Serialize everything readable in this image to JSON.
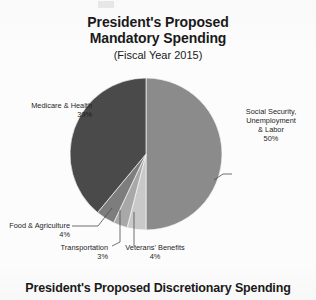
{
  "header": {
    "title_line1": "President's Proposed",
    "title_line2": "Mandatory Spending",
    "subtitle": "(Fiscal Year 2015)"
  },
  "footer": {
    "heading": "President's Proposed Discretionary Spending"
  },
  "labels": {
    "medicare_name": "Medicare & Health",
    "medicare_value": "39%",
    "social_line1": "Social Security,",
    "social_line2": "Unemployment",
    "social_line3": "& Labor",
    "social_value": "50%",
    "food_name": "Food & Agriculture",
    "food_value": "4%",
    "transport_name": "Transportation",
    "transport_value": "3%",
    "vets_name": "Veterans' Benefits",
    "vets_value": "4%"
  },
  "chart_data": {
    "type": "pie",
    "title": "President's Proposed Mandatory Spending (Fiscal Year 2015)",
    "subtitle": "(Fiscal Year 2015)",
    "units": "percent of mandatory spending",
    "legend": "none (direct labels with leader lines)",
    "start_angle_deg": 0,
    "direction": "clockwise from 12 o'clock",
    "categories": [
      "Social Security, Unemployment & Labor",
      "Veterans' Benefits",
      "Transportation",
      "Food & Agriculture",
      "Medicare & Health"
    ],
    "values": [
      50,
      4,
      3,
      4,
      39
    ],
    "value_labels": [
      "50%",
      "4%",
      "3%",
      "4%",
      "39%"
    ],
    "colors": [
      "#8b8b8b",
      "#c9c9c9",
      "#a8a8a8",
      "#7d7d7d",
      "#4a4a4a"
    ],
    "total": 100
  },
  "colors": {
    "background": "#fcfcfc",
    "text": "#1a1a1a",
    "social_security": "#8b8b8b",
    "veterans": "#c9c9c9",
    "transportation": "#a8a8a8",
    "food_agriculture": "#7d7d7d",
    "medicare": "#4a4a4a",
    "leader_line": "#4d4d4d"
  }
}
